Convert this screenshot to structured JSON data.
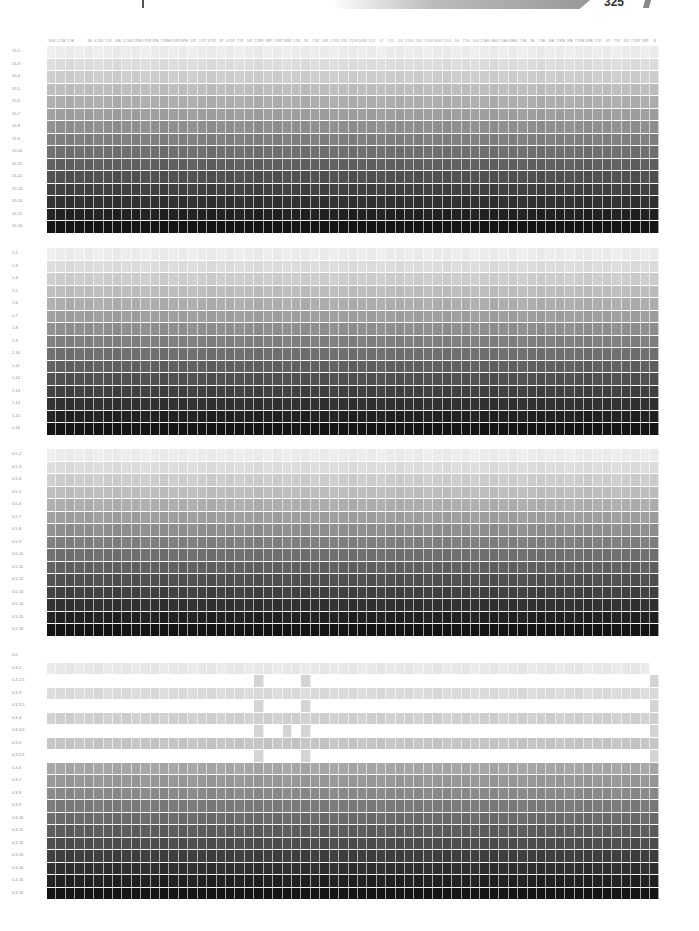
{
  "header": {
    "page_number": "325",
    "column_labels": [
      "10M",
      "1.25B",
      "2.5B",
      "",
      "5B",
      "6.25R",
      "7.5R",
      "10B",
      "12.5B",
      "2.5PB",
      "3.75PB",
      "5PB",
      "7.5PB",
      "8.75PB",
      "10PB",
      "12P",
      "2.5P",
      "3.75P",
      "5P",
      "6.25P",
      "7.5P",
      "10P",
      "2.5RP",
      "5RP",
      "7.5RP",
      "10RP",
      "2.5R",
      "5R",
      "7.5R",
      "10R",
      "2.5YR",
      "5YR",
      "7.5YR",
      "10YR",
      "2.5Y",
      "5Y",
      "7.5Y",
      "10Y",
      "2.5GY",
      "5GY",
      "7.5GY",
      "10GY",
      "2.5G",
      "5G",
      "7.5G",
      "10G",
      "2.5BG",
      "5BG",
      "7.5BG",
      "10BG",
      "2.5B",
      "5B",
      "7.5B",
      "10B",
      "2.5PB",
      "5PB",
      "7.5PB",
      "10PB",
      "2.5P",
      "5P",
      "7.5P",
      "10P",
      "2.5RP",
      "5RP",
      "N"
    ]
  },
  "blocks": [
    {
      "id": "block-15",
      "row_labels": [
        "15-2",
        "15-3",
        "15-4",
        "15-5",
        "15-6",
        "15-7",
        "15-8",
        "15-9",
        "15-10",
        "15-11",
        "15-12",
        "15-13",
        "15-14",
        "15-15",
        "15-16"
      ]
    },
    {
      "id": "block-1",
      "row_labels": [
        "1-2",
        "1-3",
        "1-4",
        "1-5",
        "1-6",
        "1-7",
        "1-8",
        "1-9",
        "1-10",
        "1-11",
        "1-12",
        "1-13",
        "1-14",
        "1-15",
        "1-16"
      ]
    },
    {
      "id": "block-05",
      "row_labels": [
        "0.5-2",
        "0.5-3",
        "0.5-4",
        "0.5-5",
        "0.5-6",
        "0.5-7",
        "0.5-8",
        "0.5-9",
        "0.5-10",
        "0.5-11",
        "0.5-12",
        "0.5-13",
        "0.5-14",
        "0.5-15",
        "0.5-16"
      ]
    },
    {
      "id": "block-03",
      "row_labels": [
        "0-0",
        "0.3-2",
        "0.3-2.5",
        "0.3-3",
        "0.3-3.5",
        "0.3-4",
        "0.3-4.5",
        "0.3-5",
        "0.3-5.5",
        "0.3-6",
        "0.3-7",
        "0.3-8",
        "0.3-9",
        "0.3-10",
        "0.3-11",
        "0.3-12",
        "0.3-13",
        "0.3-14",
        "0.3-15",
        "0.3-16"
      ]
    }
  ]
}
